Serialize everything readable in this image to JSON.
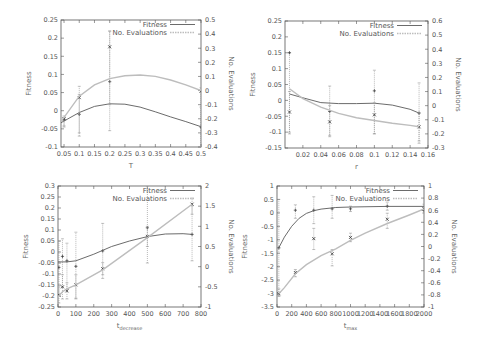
{
  "chart_data": [
    {
      "id": "plot-T",
      "type": "line",
      "frame": {
        "left": 61,
        "top": 20,
        "right": 201,
        "bottom": 147
      },
      "xlabel": "T",
      "xlabel_sub": "",
      "ylabel": "Fitness",
      "y2label": "No. Evaluations",
      "xlim": [
        0.04,
        0.5
      ],
      "ylim": [
        -0.1,
        0.25
      ],
      "y2lim": [
        -0.4,
        0.5
      ],
      "xticks": [
        0.05,
        0.1,
        0.15,
        0.2,
        0.25,
        0.3,
        0.35,
        0.4,
        0.45,
        0.5
      ],
      "xtick_labels": [
        "0.05",
        "0.1",
        "0.15",
        "0.2",
        "0.25",
        "0.3",
        "0.35",
        "0.4",
        "0.45",
        "0.5"
      ],
      "yticks": [
        -0.1,
        -0.05,
        0,
        0.05,
        0.1,
        0.15,
        0.2,
        0.25
      ],
      "ytick_labels": [
        "-0.1",
        "-0.05",
        "0",
        "0.05",
        "0.1",
        "0.15",
        "0.2",
        "0.25"
      ],
      "y2ticks": [
        -0.4,
        -0.3,
        -0.2,
        -0.1,
        0,
        0.1,
        0.2,
        0.3,
        0.4,
        0.5
      ],
      "y2tick_labels": [
        "-0.4",
        "-0.3",
        "-0.2",
        "-0.1",
        "0",
        "0.1",
        "0.2",
        "0.3",
        "0.4",
        "0.5"
      ],
      "legend": [
        "Fitness",
        "No. Evaluations"
      ],
      "series": [
        {
          "name": "Fitness",
          "axis": "y",
          "points": [
            {
              "x": 0.05,
              "y": -0.025,
              "err": [
                -0.045,
                -0.02
              ]
            },
            {
              "x": 0.1,
              "y": -0.01,
              "err": [
                -0.07,
                0.045
              ]
            },
            {
              "x": 0.2,
              "y": 0.08,
              "err": [
                -0.055,
                0.22
              ]
            },
            {
              "x": 0.5,
              "y": -0.045,
              "err": [
                -0.1,
                0.01
              ]
            }
          ],
          "curve": [
            [
              0.04,
              -0.033
            ],
            [
              0.1,
              -0.005
            ],
            [
              0.15,
              0.012
            ],
            [
              0.2,
              0.019
            ],
            [
              0.25,
              0.018
            ],
            [
              0.3,
              0.01
            ],
            [
              0.35,
              -0.003
            ],
            [
              0.4,
              -0.017
            ],
            [
              0.45,
              -0.03
            ],
            [
              0.5,
              -0.044
            ]
          ]
        },
        {
          "name": "No. Evaluations",
          "axis": "y2",
          "points": [
            {
              "x": 0.05,
              "y": -0.2,
              "err": [
                -0.25,
                -0.18
              ]
            },
            {
              "x": 0.1,
              "y": -0.05,
              "err": [
                -0.3,
                0.03
              ]
            },
            {
              "x": 0.2,
              "y": 0.31,
              "err": [
                -0.1,
                0.42
              ]
            },
            {
              "x": 0.5,
              "y": -0.005,
              "err": [
                -0.4,
                0.02
              ]
            }
          ],
          "curve": [
            [
              0.04,
              -0.22
            ],
            [
              0.1,
              -0.04
            ],
            [
              0.15,
              0.04
            ],
            [
              0.2,
              0.085
            ],
            [
              0.25,
              0.105
            ],
            [
              0.3,
              0.11
            ],
            [
              0.35,
              0.1
            ],
            [
              0.4,
              0.075
            ],
            [
              0.45,
              0.04
            ],
            [
              0.5,
              0.0
            ]
          ]
        }
      ]
    },
    {
      "id": "plot-r",
      "type": "line",
      "frame": {
        "left": 285,
        "top": 21,
        "right": 428,
        "bottom": 148
      },
      "xlabel": "r",
      "xlabel_sub": "",
      "ylabel": "Fitness",
      "y2label": "No. Evaluations",
      "xlim": [
        0.0,
        0.16
      ],
      "ylim": [
        -0.15,
        0.25
      ],
      "y2lim": [
        -0.3,
        0.6
      ],
      "xticks": [
        0.02,
        0.04,
        0.06,
        0.08,
        0.1,
        0.12,
        0.14,
        0.16
      ],
      "xtick_labels": [
        "0.02",
        "0.04",
        "0.06",
        "0.08",
        "0.1",
        "0.12",
        "0.14",
        "0.16"
      ],
      "yticks": [
        -0.15,
        -0.1,
        -0.05,
        0,
        0.05,
        0.1,
        0.15,
        0.2,
        0.25
      ],
      "ytick_labels": [
        "-0.15",
        "-0.1",
        "-0.05",
        "0",
        "0.05",
        "0.1",
        "0.15",
        "0.2",
        "0.25"
      ],
      "y2ticks": [
        -0.3,
        -0.2,
        -0.1,
        0,
        0.1,
        0.2,
        0.3,
        0.4,
        0.5,
        0.6
      ],
      "y2tick_labels": [
        "-0.3",
        "-0.2",
        "-0.1",
        "0",
        "0.1",
        "0.2",
        "0.3",
        "0.4",
        "0.5",
        "0.6"
      ],
      "legend": [
        "Fitness",
        "No. Evaluations"
      ],
      "series": [
        {
          "name": "Fitness",
          "axis": "y",
          "points": [
            {
              "x": 0.005,
              "y": 0.15,
              "err": [
                -0.1,
                0.15
              ]
            },
            {
              "x": 0.05,
              "y": -0.035,
              "err": [
                -0.11,
                0.045
              ]
            },
            {
              "x": 0.1,
              "y": 0.03,
              "err": [
                -0.105,
                0.095
              ]
            },
            {
              "x": 0.15,
              "y": -0.04,
              "err": [
                -0.135,
                0.055
              ]
            }
          ],
          "curve": [
            [
              0.005,
              0.02
            ],
            [
              0.02,
              0.008
            ],
            [
              0.04,
              -0.007
            ],
            [
              0.06,
              -0.01
            ],
            [
              0.08,
              -0.01
            ],
            [
              0.1,
              -0.009
            ],
            [
              0.12,
              -0.015
            ],
            [
              0.14,
              -0.028
            ],
            [
              0.15,
              -0.04
            ]
          ]
        },
        {
          "name": "No. Evaluations",
          "axis": "y2",
          "points": [
            {
              "x": 0.005,
              "y": -0.045,
              "err": [
                -0.2,
                0.1
              ]
            },
            {
              "x": 0.05,
              "y": -0.115,
              "err": [
                -0.22,
                0.0
              ]
            },
            {
              "x": 0.1,
              "y": -0.065,
              "err": [
                -0.2,
                0.02
              ]
            },
            {
              "x": 0.15,
              "y": -0.15,
              "err": [
                -0.25,
                -0.05
              ]
            }
          ],
          "curve": [
            [
              0.005,
              0.12
            ],
            [
              0.02,
              0.05
            ],
            [
              0.04,
              -0.01
            ],
            [
              0.06,
              -0.055
            ],
            [
              0.08,
              -0.085
            ],
            [
              0.1,
              -0.105
            ],
            [
              0.12,
              -0.125
            ],
            [
              0.14,
              -0.14
            ],
            [
              0.15,
              -0.15
            ]
          ]
        }
      ]
    },
    {
      "id": "plot-tdecrease",
      "type": "line",
      "frame": {
        "left": 58,
        "top": 186,
        "right": 201,
        "bottom": 307
      },
      "xlabel": "t",
      "xlabel_sub": "decrease",
      "ylabel": "Fitness",
      "y2label": "No. Evaluations",
      "xlim": [
        0,
        800
      ],
      "ylim": [
        -0.25,
        0.3
      ],
      "y2lim": [
        -1,
        2
      ],
      "xticks": [
        0,
        100,
        200,
        300,
        400,
        500,
        600,
        700,
        800
      ],
      "xtick_labels": [
        "0",
        "100",
        "200",
        "300",
        "400",
        "500",
        "600",
        "700",
        "800"
      ],
      "yticks": [
        -0.25,
        -0.2,
        -0.15,
        -0.1,
        -0.05,
        0,
        0.05,
        0.1,
        0.15,
        0.2,
        0.25,
        0.3
      ],
      "ytick_labels": [
        "-0.25",
        "-0.2",
        "-0.15",
        "-0.1",
        "-0.05",
        "0",
        "0.05",
        "0.1",
        "0.15",
        "0.2",
        "0.25",
        "0.3"
      ],
      "y2ticks": [
        -1,
        -0.5,
        0,
        0.5,
        1,
        1.5,
        2
      ],
      "y2tick_labels": [
        "-1",
        "-0.5",
        "0",
        "0.5",
        "1",
        "1.5",
        "2"
      ],
      "legend": [
        "Fitness",
        "No. Evaluations"
      ],
      "series": [
        {
          "name": "Fitness",
          "axis": "y",
          "points": [
            {
              "x": 5,
              "y": -0.07,
              "err": [
                -0.2,
                0.05
              ]
            },
            {
              "x": 25,
              "y": -0.02,
              "err": [
                -0.16,
                0.06
              ]
            },
            {
              "x": 50,
              "y": -0.04,
              "err": [
                -0.17,
                0.04
              ]
            },
            {
              "x": 100,
              "y": -0.065,
              "err": [
                -0.21,
                0.09
              ]
            },
            {
              "x": 250,
              "y": 0.005,
              "err": [
                -0.12,
                0.13
              ]
            },
            {
              "x": 500,
              "y": 0.11,
              "err": [
                -0.05,
                0.3
              ]
            },
            {
              "x": 750,
              "y": 0.08,
              "err": [
                -0.04,
                0.21
              ]
            }
          ],
          "curve": [
            [
              0,
              -0.045
            ],
            [
              50,
              -0.045
            ],
            [
              100,
              -0.04
            ],
            [
              200,
              -0.01
            ],
            [
              300,
              0.025
            ],
            [
              400,
              0.05
            ],
            [
              500,
              0.07
            ],
            [
              600,
              0.082
            ],
            [
              700,
              0.083
            ],
            [
              750,
              0.08
            ]
          ]
        },
        {
          "name": "No. Evaluations",
          "axis": "y2",
          "points": [
            {
              "x": 5,
              "y": -0.7,
              "err": [
                -0.9,
                -0.5
              ]
            },
            {
              "x": 25,
              "y": -0.5,
              "err": [
                -0.8,
                -0.2
              ]
            },
            {
              "x": 50,
              "y": -0.6,
              "err": [
                -0.8,
                -0.4
              ]
            },
            {
              "x": 100,
              "y": -0.45,
              "err": [
                -0.8,
                -0.2
              ]
            },
            {
              "x": 250,
              "y": -0.05,
              "err": [
                -0.2,
                0.1
              ]
            },
            {
              "x": 500,
              "y": 0.75,
              "err": [
                0.5,
                1.0
              ]
            },
            {
              "x": 750,
              "y": 1.55,
              "err": [
                1.3,
                1.7
              ]
            }
          ],
          "curve": [
            [
              0,
              -0.75
            ],
            [
              25,
              -0.62
            ],
            [
              50,
              -0.55
            ],
            [
              100,
              -0.45
            ],
            [
              250,
              -0.08
            ],
            [
              500,
              0.72
            ],
            [
              750,
              1.55
            ]
          ]
        }
      ]
    },
    {
      "id": "plot-tmax",
      "type": "line",
      "frame": {
        "left": 277,
        "top": 186,
        "right": 424,
        "bottom": 307
      },
      "xlabel": "t",
      "xlabel_sub": "max",
      "ylabel": "Fitness",
      "y2label": "No. Evaluations",
      "xlim": [
        0,
        2000
      ],
      "ylim": [
        -3.5,
        1
      ],
      "y2lim": [
        -1,
        1
      ],
      "xticks": [
        0,
        200,
        400,
        600,
        800,
        1000,
        1200,
        1400,
        1600,
        1800,
        2000
      ],
      "xtick_labels": [
        "0",
        "200",
        "400",
        "600",
        "800",
        "1000",
        "1200",
        "1400",
        "1600",
        "1800",
        "2000"
      ],
      "yticks": [
        -3.5,
        -3,
        -2.5,
        -2,
        -1.5,
        -1,
        -0.5,
        0,
        0.5,
        1
      ],
      "ytick_labels": [
        "-3.5",
        "-3",
        "-2.5",
        "-2",
        "-1.5",
        "-1",
        "-0.5",
        "0",
        "0.5",
        "1"
      ],
      "y2ticks": [
        -1,
        -0.8,
        -0.6,
        -0.4,
        -0.2,
        0,
        0.2,
        0.4,
        0.6,
        0.8,
        1
      ],
      "y2tick_labels": [
        "-1",
        "-0.8",
        "-0.6",
        "-0.4",
        "-0.2",
        "0",
        "0.2",
        "0.4",
        "0.6",
        "0.8",
        "1"
      ],
      "legend": [
        "Fitness",
        "No. Evaluations"
      ],
      "series": [
        {
          "name": "Fitness",
          "axis": "y",
          "points": [
            {
              "x": 25,
              "y": -1.3,
              "err": [
                -3.1,
                0.5
              ]
            },
            {
              "x": 250,
              "y": 0.1,
              "err": [
                -0.2,
                0.3
              ]
            },
            {
              "x": 500,
              "y": 0.1,
              "err": [
                -0.4,
                0.6
              ]
            },
            {
              "x": 750,
              "y": 0.15,
              "err": [
                -0.2,
                0.65
              ]
            },
            {
              "x": 1000,
              "y": 0.15,
              "err": [
                0.05,
                0.25
              ]
            },
            {
              "x": 1500,
              "y": 0.25,
              "err": [
                0.1,
                0.4
              ]
            },
            {
              "x": 2000,
              "y": 0.1,
              "err": [
                0.0,
                0.2
              ]
            }
          ],
          "curve": [
            [
              25,
              -1.3
            ],
            [
              100,
              -0.9
            ],
            [
              200,
              -0.5
            ],
            [
              300,
              -0.2
            ],
            [
              400,
              -0.02
            ],
            [
              500,
              0.08
            ],
            [
              600,
              0.14
            ],
            [
              800,
              0.2
            ],
            [
              1000,
              0.22
            ],
            [
              1500,
              0.24
            ],
            [
              2000,
              0.24
            ]
          ]
        },
        {
          "name": "No. Evaluations",
          "axis": "y2",
          "points": [
            {
              "x": 25,
              "y": -0.78,
              "err": [
                -0.82,
                -0.7
              ]
            },
            {
              "x": 250,
              "y": -0.43,
              "err": [
                -0.5,
                -0.38
              ]
            },
            {
              "x": 500,
              "y": 0.13,
              "err": [
                -0.05,
                0.3
              ]
            },
            {
              "x": 750,
              "y": -0.12,
              "err": [
                -0.32,
                -0.05
              ]
            },
            {
              "x": 1000,
              "y": 0.15,
              "err": [
                0.08,
                0.22
              ]
            },
            {
              "x": 1500,
              "y": 0.45,
              "err": [
                0.3,
                0.55
              ]
            },
            {
              "x": 2000,
              "y": 0.62,
              "err": [
                0.55,
                0.7
              ]
            }
          ],
          "curve": [
            [
              25,
              -0.78
            ],
            [
              100,
              -0.68
            ],
            [
              250,
              -0.45
            ],
            [
              400,
              -0.3
            ],
            [
              600,
              -0.15
            ],
            [
              800,
              -0.04
            ],
            [
              1000,
              0.1
            ],
            [
              1200,
              0.22
            ],
            [
              1500,
              0.38
            ],
            [
              1800,
              0.52
            ],
            [
              2000,
              0.62
            ]
          ]
        }
      ]
    }
  ],
  "colors": {
    "fitness_line": "#5a5a5a",
    "evaluations_line": "#bdbdbd",
    "frame": "#555555",
    "errorbar": "#9a9a9a",
    "marker": "#333333"
  }
}
